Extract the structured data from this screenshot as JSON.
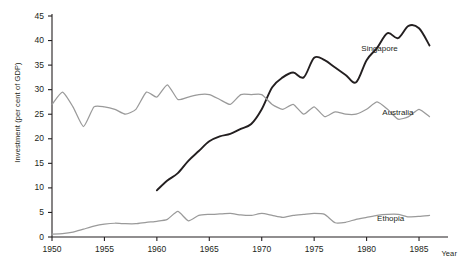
{
  "chart_data": {
    "type": "line",
    "title": "",
    "xlabel": "Year",
    "ylabel": "Investment (per cent of GDP)",
    "xlim": [
      1950,
      1987
    ],
    "ylim": [
      0,
      45
    ],
    "grid": false,
    "legend_position": "inline-right",
    "xticks": [
      1950,
      1955,
      1960,
      1965,
      1970,
      1975,
      1980,
      1985
    ],
    "yticks": [
      0,
      5,
      10,
      15,
      20,
      25,
      30,
      35,
      40,
      45
    ],
    "series": [
      {
        "name": "Singapore",
        "color": "#231f20",
        "label_x": 1979.5,
        "label_y": 38.2,
        "x": [
          1960,
          1961,
          1962,
          1963,
          1964,
          1965,
          1966,
          1967,
          1968,
          1969,
          1970,
          1971,
          1972,
          1973,
          1974,
          1975,
          1976,
          1977,
          1978,
          1979,
          1980,
          1981,
          1982,
          1983,
          1984,
          1985,
          1986
        ],
        "values": [
          9.5,
          11.5,
          13.0,
          15.5,
          17.5,
          19.5,
          20.5,
          21.0,
          22.0,
          23.0,
          26.0,
          30.5,
          32.5,
          33.5,
          32.5,
          36.5,
          36.0,
          34.5,
          33.0,
          31.5,
          36.0,
          38.5,
          41.5,
          40.5,
          43.0,
          42.5,
          39.0
        ]
      },
      {
        "name": "Australia",
        "color": "#9a9a9a",
        "label_x": 1981.5,
        "label_y": 25.2,
        "x": [
          1950,
          1951,
          1952,
          1953,
          1954,
          1955,
          1956,
          1957,
          1958,
          1959,
          1960,
          1961,
          1962,
          1963,
          1964,
          1965,
          1966,
          1967,
          1968,
          1969,
          1970,
          1971,
          1972,
          1973,
          1974,
          1975,
          1976,
          1977,
          1978,
          1979,
          1980,
          1981,
          1982,
          1983,
          1984,
          1985,
          1986
        ],
        "values": [
          27.0,
          29.5,
          26.5,
          22.5,
          26.5,
          26.5,
          26.0,
          25.0,
          26.0,
          29.5,
          28.5,
          31.0,
          28.0,
          28.5,
          29.0,
          29.0,
          28.0,
          27.0,
          29.0,
          29.0,
          29.0,
          27.0,
          26.0,
          27.0,
          25.0,
          26.5,
          24.5,
          25.5,
          25.0,
          25.0,
          26.0,
          27.5,
          26.0,
          24.0,
          24.5,
          26.0,
          24.5
        ]
      },
      {
        "name": "Ethopia",
        "color": "#9a9a9a",
        "label_x": 1981.0,
        "label_y": 3.6,
        "x": [
          1950,
          1951,
          1952,
          1953,
          1954,
          1955,
          1956,
          1957,
          1958,
          1959,
          1960,
          1961,
          1962,
          1963,
          1964,
          1965,
          1966,
          1967,
          1968,
          1969,
          1970,
          1971,
          1972,
          1973,
          1974,
          1975,
          1976,
          1977,
          1978,
          1979,
          1980,
          1981,
          1982,
          1983,
          1984,
          1985,
          1986
        ],
        "values": [
          0.6,
          0.7,
          1.0,
          1.6,
          2.2,
          2.6,
          2.8,
          2.7,
          2.7,
          3.0,
          3.2,
          3.6,
          5.2,
          3.3,
          4.4,
          4.6,
          4.7,
          4.8,
          4.5,
          4.4,
          4.8,
          4.4,
          4.0,
          4.4,
          4.6,
          4.8,
          4.6,
          2.9,
          3.0,
          3.6,
          4.0,
          4.4,
          4.6,
          4.6,
          4.1,
          4.2,
          4.4
        ]
      }
    ]
  }
}
